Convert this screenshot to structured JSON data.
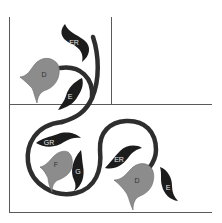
{
  "colors": {
    "background": "#ffffff",
    "grid_line": "#5a5a5a",
    "vine": "#2e2e2e",
    "leaf": "#1c1c1c",
    "flower": "#8c8c8c",
    "flower_outline": "#6a6a6a"
  },
  "flowers": [
    {
      "id": "flower-top",
      "label": "D"
    },
    {
      "id": "flower-middle",
      "label": "F"
    },
    {
      "id": "flower-bottom-right",
      "label": "D"
    }
  ],
  "leaves": [
    {
      "id": "leaf-top",
      "label": "ER"
    },
    {
      "id": "leaf-top-lower",
      "label": "E"
    },
    {
      "id": "leaf-middle-upper",
      "label": "GR"
    },
    {
      "id": "leaf-middle-right",
      "label": "G"
    },
    {
      "id": "leaf-bottom-left",
      "label": "ER"
    },
    {
      "id": "leaf-bottom-right",
      "label": "E"
    }
  ]
}
